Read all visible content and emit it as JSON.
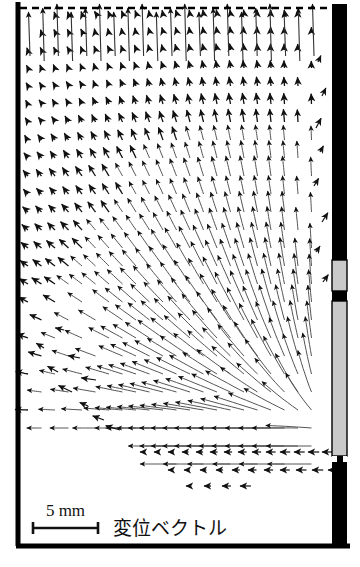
{
  "figure": {
    "title": "",
    "type": "vector-field",
    "domain_note": "displacement vector field diagram",
    "scale_bar": {
      "label": "5 mm",
      "length_px": 65,
      "x_start": 33,
      "x_end": 98,
      "y": 528
    },
    "legend_label": "変位ベクトル",
    "frame": {
      "left_border_x": 18,
      "bottom_border_y": 546,
      "border_color": "#000000",
      "border_thickness": 5
    },
    "top_dashed_line": {
      "y": 8,
      "x_start": 20,
      "x_end": 333,
      "dash": "7,5",
      "color": "#000000"
    },
    "right_wall": {
      "x": 332,
      "width": 15,
      "color": "#000000",
      "segments": [
        {
          "name": "upper-black",
          "y": 4,
          "height": 256,
          "fill": "#000000"
        },
        {
          "name": "upper-gray-window",
          "y": 260,
          "height": 31,
          "fill": "#c9c9c9"
        },
        {
          "name": "middle-black-divider",
          "y": 291,
          "height": 10,
          "fill": "#000000"
        },
        {
          "name": "lower-gray-window",
          "y": 301,
          "height": 155,
          "fill": "#c9c9c9"
        },
        {
          "name": "gap-white",
          "y": 456,
          "height": 6,
          "fill": "#ffffff"
        },
        {
          "name": "bottom-black",
          "y": 462,
          "height": 86,
          "fill": "#000000"
        }
      ],
      "narrow_stem": {
        "x": 337,
        "width": 6,
        "y": 456,
        "height": 8,
        "fill": "#000000"
      }
    },
    "colors": {
      "background": "#ffffff",
      "ink": "#000000",
      "arrow": "#1a1a1a",
      "gray_fill": "#c9c9c9",
      "curve": "#4a4a4a"
    }
  },
  "chart_data": {
    "type": "scatter",
    "title": "",
    "xlabel": "",
    "ylabel": "",
    "grid": false,
    "legend_position": "bottom-left",
    "annotations": [
      "5 mm",
      "変位ベクトル"
    ],
    "field": {
      "x_range": [
        25,
        330
      ],
      "y_range": [
        8,
        490
      ],
      "columns": 22,
      "rows": 26,
      "col_spacing": 13.5,
      "row_spacing": 18.0,
      "origin_x": 28,
      "origin_y": 14
    }
  }
}
